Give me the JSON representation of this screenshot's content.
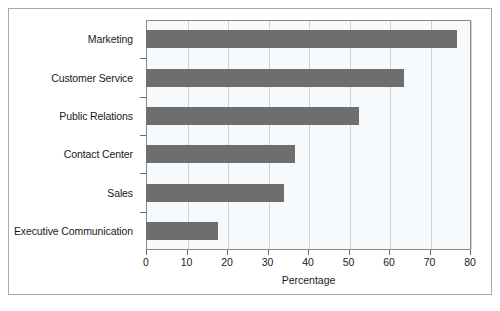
{
  "chart_data": {
    "type": "bar",
    "orientation": "horizontal",
    "title": "",
    "xlabel": "Percentage",
    "ylabel": "",
    "categories": [
      "Marketing",
      "Customer Service",
      "Public Relations",
      "Contact Center",
      "Sales",
      "Executive Communication"
    ],
    "values": [
      76.8,
      63.7,
      52.6,
      36.8,
      34.1,
      17.8
    ],
    "xlim": [
      0,
      80
    ],
    "xticks": [
      0,
      10,
      20,
      30,
      40,
      50,
      60,
      70,
      80
    ],
    "xtick_labels": [
      "0",
      "10",
      "20",
      "30",
      "40",
      "50",
      "60",
      "70",
      "80"
    ],
    "grid": "vertical",
    "legend": "none",
    "bar_color": "#6e6e6e",
    "plot_background": "#f6fafc",
    "gridline_color": "#c8d2d8",
    "axis_color": "#8a8a8a",
    "figure_border_color": "#a9a9a9"
  }
}
